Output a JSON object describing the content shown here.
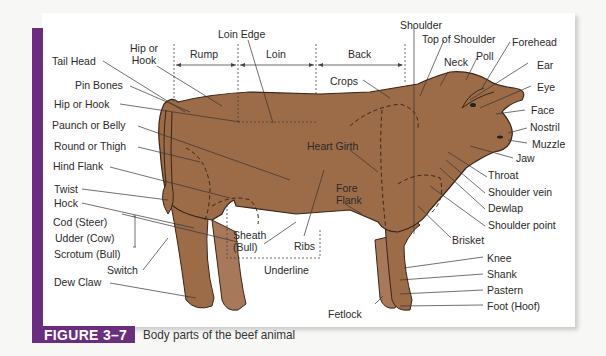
{
  "figure": {
    "number": "FIGURE 3–7",
    "caption": "Body parts of the beef animal",
    "accent_color": "#6b2d7e",
    "body_color": "#9c6b48"
  },
  "regions": {
    "top": [
      "Rump",
      "Loin",
      "Back"
    ],
    "bottom": "Underline"
  },
  "labels": {
    "hip_or_hook_top": "Hip or\nHook",
    "loin_edge": "Loin Edge",
    "rump": "Rump",
    "loin": "Loin",
    "back": "Back",
    "crops": "Crops",
    "shoulder": "Shoulder",
    "top_of_shoulder": "Top of Shoulder",
    "neck": "Neck",
    "poll": "Poll",
    "forehead": "Forehead",
    "ear": "Ear",
    "eye": "Eye",
    "face": "Face",
    "nostril": "Nostril",
    "muzzle": "Muzzle",
    "jaw": "Jaw",
    "throat": "Throat",
    "shoulder_vein": "Shoulder vein",
    "dewlap": "Dewlap",
    "shoulder_point": "Shoulder point",
    "brisket": "Brisket",
    "knee": "Knee",
    "shank": "Shank",
    "pastern": "Pastern",
    "foot": "Foot (Hoof)",
    "fetlock": "Fetlock",
    "tail_head": "Tail Head",
    "pin_bones": "Pin Bones",
    "hip_or_hook": "Hip or Hook",
    "paunch": "Paunch or Belly",
    "round": "Round or Thigh",
    "hind_flank": "Hind Flank",
    "twist": "Twist",
    "hock": "Hock",
    "cod": "Cod (Steer)",
    "udder": "Udder (Cow)",
    "scrotum": "Scrotum (Bull)",
    "switch": "Switch",
    "dew_claw": "Dew Claw",
    "heart_girth": "Heart Girth",
    "fore_flank": "Fore\nFlank",
    "sheath": "Sheath\n(Bull)",
    "ribs": "Ribs",
    "underline": "Underline"
  }
}
